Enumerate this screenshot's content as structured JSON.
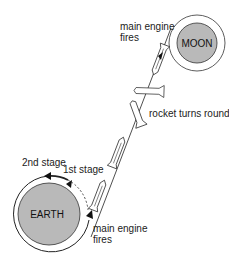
{
  "diagram": {
    "bodies": {
      "moon": {
        "label": "MOON",
        "fill": "#b9b9b9"
      },
      "earth": {
        "label": "EARTH",
        "fill": "#b9b9b9"
      }
    },
    "labels": {
      "main_engine_fires_top_line1": "main engine",
      "main_engine_fires_top_line2": "fires",
      "rocket_turns_round": "rocket turns round",
      "second_stage": "2nd stage",
      "first_stage": "1st stage",
      "main_engine_fires_bottom_line1": "main engine",
      "main_engine_fires_bottom_line2": "fires"
    },
    "colors": {
      "line": "#222222",
      "body_fill": "#b9b9b9",
      "background": "#ffffff"
    }
  }
}
